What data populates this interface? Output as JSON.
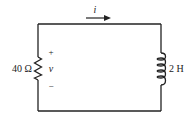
{
  "diagram": {
    "type": "RL circuit",
    "current_label": "i",
    "resistor": {
      "label": "40 Ω"
    },
    "voltage": {
      "plus": "+",
      "symbol": "v",
      "minus": "−"
    },
    "inductor": {
      "label": "2 H"
    }
  }
}
